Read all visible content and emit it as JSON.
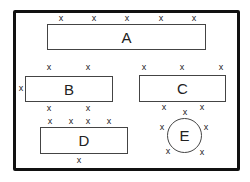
{
  "diagram": {
    "mark_glyph": "x",
    "shapes": [
      {
        "id": "A",
        "label": "A",
        "type": "rectangle"
      },
      {
        "id": "B",
        "label": "B",
        "type": "rectangle"
      },
      {
        "id": "C",
        "label": "C",
        "type": "rectangle"
      },
      {
        "id": "D",
        "label": "D",
        "type": "rectangle"
      },
      {
        "id": "E",
        "label": "E",
        "type": "circle"
      }
    ],
    "marks": {
      "A": 5,
      "B": 5,
      "C": 6,
      "D": 5,
      "E": 6
    }
  }
}
